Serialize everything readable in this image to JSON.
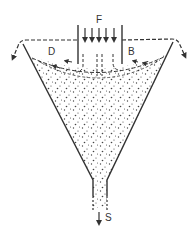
{
  "diagram": {
    "type": "hydrocyclone-settling-cone",
    "labels": {
      "feed": "F",
      "left_overflow": "D",
      "right_overflow": "B",
      "underflow": "S"
    },
    "colors": {
      "stroke": "#333333",
      "particles": "#444444",
      "background": "#ffffff"
    }
  }
}
